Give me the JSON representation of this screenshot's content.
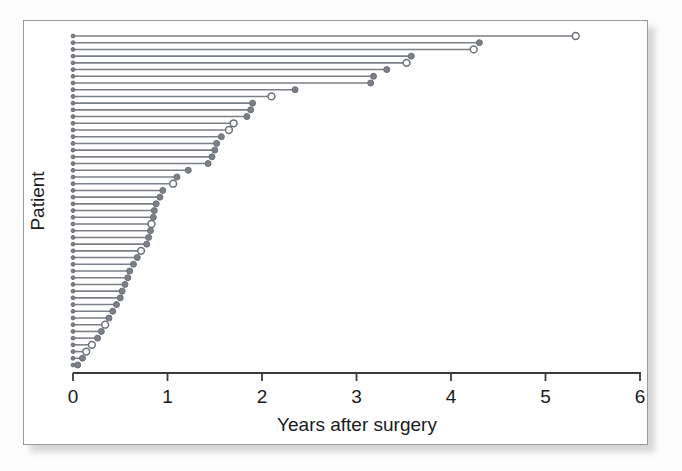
{
  "figure": {
    "type": "statistical-figure",
    "caption_present": false
  },
  "chart_data": {
    "type": "scatter",
    "subtype": "lollipop-followup-plot",
    "title": "",
    "xlabel": "Years after surgery",
    "ylabel": "Patient",
    "xlim": [
      0,
      6
    ],
    "ylim_note": "Patients sorted by decreasing follow-up time; y axis unlabeled ticks",
    "xticks": [
      0,
      1,
      2,
      3,
      4,
      5,
      6
    ],
    "xtick_labels": [
      "0",
      "1",
      "2",
      "3",
      "4",
      "5",
      "6"
    ],
    "grid": false,
    "legend_present": false,
    "marker_styles": {
      "event": {
        "name": "filled-circle",
        "fill": "#7b7f86",
        "meaning": "event / death"
      },
      "censored": {
        "name": "open-circle",
        "fill": "#ffffff",
        "meaning": "censored / still at risk"
      }
    },
    "colors": {
      "line": "#7b7f86",
      "axis": "#3a3a3a",
      "panel_background": "#ffffff",
      "panel_border": "#9a9a9a",
      "text": "#1a1a1a"
    },
    "x_origin": 0,
    "n_patients": 50,
    "series": [
      {
        "name": "Follow-up time (years)",
        "values": [
          5.32,
          4.3,
          4.24,
          3.58,
          3.53,
          3.32,
          3.18,
          3.15,
          2.35,
          2.1,
          1.9,
          1.88,
          1.84,
          1.7,
          1.65,
          1.57,
          1.52,
          1.5,
          1.47,
          1.43,
          1.22,
          1.1,
          1.06,
          0.95,
          0.92,
          0.88,
          0.86,
          0.85,
          0.83,
          0.82,
          0.8,
          0.78,
          0.72,
          0.68,
          0.64,
          0.6,
          0.58,
          0.55,
          0.52,
          0.5,
          0.46,
          0.42,
          0.38,
          0.34,
          0.3,
          0.26,
          0.2,
          0.14,
          0.1,
          0.05
        ]
      },
      {
        "name": "Status",
        "values": [
          "censored",
          "event",
          "censored",
          "event",
          "censored",
          "event",
          "event",
          "event",
          "event",
          "censored",
          "event",
          "event",
          "event",
          "censored",
          "censored",
          "event",
          "event",
          "event",
          "event",
          "event",
          "event",
          "event",
          "censored",
          "event",
          "event",
          "event",
          "event",
          "event",
          "censored",
          "event",
          "event",
          "event",
          "censored",
          "event",
          "event",
          "event",
          "event",
          "event",
          "event",
          "event",
          "event",
          "event",
          "event",
          "censored",
          "event",
          "event",
          "censored",
          "censored",
          "event",
          "event"
        ]
      }
    ]
  },
  "axis": {
    "x_title": "Years after surgery",
    "y_title": "Patient",
    "tick_0": "0",
    "tick_1": "1",
    "tick_2": "2",
    "tick_3": "3",
    "tick_4": "4",
    "tick_5": "5",
    "tick_6": "6"
  }
}
